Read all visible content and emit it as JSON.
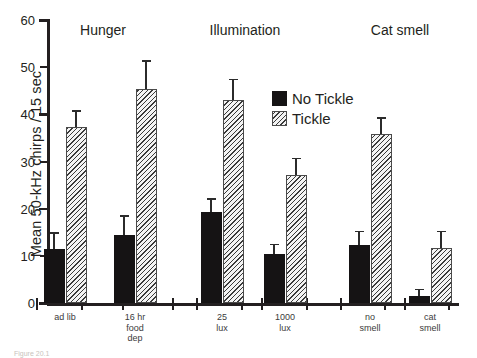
{
  "chart_data": {
    "type": "bar",
    "title": "",
    "xlabel": "",
    "ylabel": "Mean 50-kHz chirps / 15 sec",
    "ylim": [
      0,
      60
    ],
    "yticks": [
      0,
      10,
      20,
      30,
      40,
      50,
      60
    ],
    "grid": false,
    "legend_position": "upper right inside",
    "categories": [
      "ad lib",
      "16 hr\nfood\ndep",
      "25\nlux",
      "1000\nlux",
      "no\nsmell",
      "cat\nsmell"
    ],
    "group_headers": [
      {
        "label": "Hunger",
        "categories": [
          "ad lib",
          "16 hr food dep"
        ]
      },
      {
        "label": "Illumination",
        "categories": [
          "25 lux",
          "1000 lux"
        ]
      },
      {
        "label": "Cat smell",
        "categories": [
          "no smell",
          "cat smell"
        ]
      }
    ],
    "series": [
      {
        "name": "No Tickle",
        "color": "#151314",
        "pattern": "solid",
        "values": [
          11.5,
          14.5,
          19.3,
          10.4,
          12.4,
          1.5
        ],
        "errors": [
          3.2,
          3.8,
          2.6,
          1.8,
          2.6,
          1.2
        ]
      },
      {
        "name": "Tickle",
        "color": "#f2f2f2",
        "pattern": "diagonal-hatch",
        "values": [
          37.3,
          45.3,
          43.0,
          27.2,
          35.8,
          11.7
        ],
        "errors": [
          3.3,
          5.8,
          4.2,
          3.3,
          3.3,
          3.3
        ]
      }
    ]
  },
  "legend": {
    "items": [
      {
        "label": "No Tickle",
        "pattern": "solid"
      },
      {
        "label": "Tickle",
        "pattern": "diagonal-hatch"
      }
    ]
  },
  "caption": "Figure 20.1"
}
